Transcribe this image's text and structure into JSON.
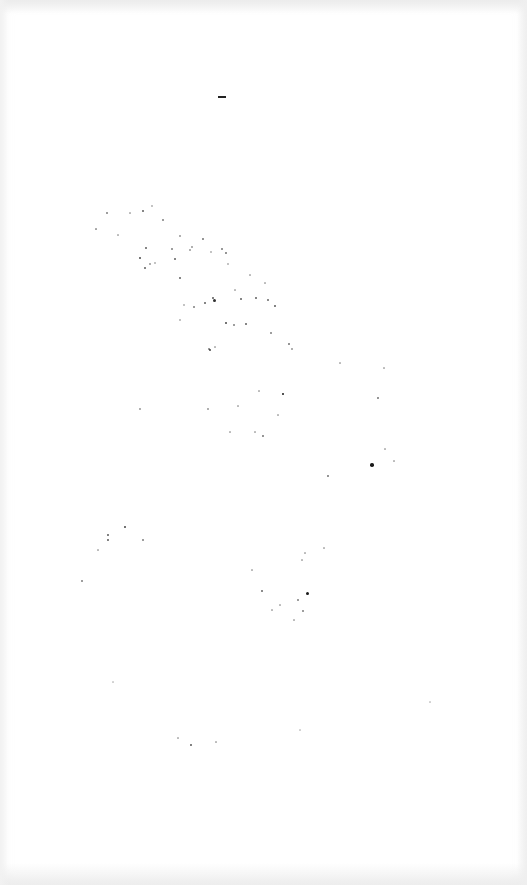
{
  "image": {
    "description": "Near-blank white sheet with scattered dust/speckle noise",
    "background_color": "#ffffff",
    "edge_tint": "#ececec",
    "speckle_color": "#1a1a1a",
    "marks": [
      {
        "type": "dash",
        "x": 218,
        "y": 96,
        "w": 8,
        "h": 2
      }
    ],
    "speckles": [
      [
        107,
        213,
        1.5,
        0.5
      ],
      [
        130,
        213,
        1.2,
        0.3
      ],
      [
        143,
        211,
        2,
        0.7
      ],
      [
        152,
        206,
        1.3,
        0.3
      ],
      [
        163,
        220,
        1.5,
        0.5
      ],
      [
        96,
        229,
        1.2,
        0.4
      ],
      [
        118,
        235,
        1.2,
        0.3
      ],
      [
        146,
        248,
        2,
        0.7
      ],
      [
        140,
        258,
        2.2,
        0.8
      ],
      [
        145,
        268,
        2,
        0.7
      ],
      [
        150,
        264,
        1.3,
        0.4
      ],
      [
        155,
        263,
        1.3,
        0.3
      ],
      [
        172,
        249,
        1.5,
        0.5
      ],
      [
        175,
        259,
        2,
        0.7
      ],
      [
        180,
        236,
        1.3,
        0.4
      ],
      [
        190,
        250,
        1.5,
        0.4
      ],
      [
        192,
        247,
        1.3,
        0.4
      ],
      [
        203,
        239,
        1.8,
        0.6
      ],
      [
        211,
        252,
        1.3,
        0.3
      ],
      [
        222,
        249,
        2,
        0.6
      ],
      [
        226,
        253,
        1.8,
        0.6
      ],
      [
        228,
        264,
        1.3,
        0.3
      ],
      [
        180,
        278,
        2,
        0.7
      ],
      [
        213,
        298,
        1.8,
        0.7
      ],
      [
        214,
        300,
        3,
        0.9
      ],
      [
        205,
        303,
        2,
        0.7
      ],
      [
        194,
        307,
        1.5,
        0.5
      ],
      [
        241,
        299,
        2,
        0.7
      ],
      [
        256,
        298,
        2,
        0.7
      ],
      [
        268,
        300,
        1.6,
        0.6
      ],
      [
        275,
        306,
        1.8,
        0.7
      ],
      [
        226,
        323,
        2.2,
        0.8
      ],
      [
        234,
        325,
        1.5,
        0.5
      ],
      [
        246,
        324,
        2,
        0.7
      ],
      [
        271,
        333,
        1.5,
        0.5
      ],
      [
        209,
        349,
        1.5,
        0.5
      ],
      [
        215,
        347,
        1.2,
        0.3
      ],
      [
        289,
        344,
        1.8,
        0.6
      ],
      [
        292,
        349,
        1.3,
        0.4
      ],
      [
        210,
        350,
        2.4,
        0.8
      ],
      [
        180,
        320,
        1.3,
        0.3
      ],
      [
        184,
        305,
        1.3,
        0.3
      ],
      [
        250,
        275,
        1.2,
        0.3
      ],
      [
        265,
        283,
        1.2,
        0.3
      ],
      [
        235,
        290,
        1.2,
        0.3
      ],
      [
        259,
        391,
        1.2,
        0.3
      ],
      [
        283,
        394,
        2.6,
        1
      ],
      [
        238,
        406,
        1.2,
        0.3
      ],
      [
        263,
        436,
        1.8,
        0.6
      ],
      [
        278,
        415,
        1.2,
        0.3
      ],
      [
        340,
        363,
        1.2,
        0.3
      ],
      [
        378,
        398,
        1.8,
        0.6
      ],
      [
        384,
        368,
        1.2,
        0.3
      ],
      [
        372,
        465,
        3.5,
        1
      ],
      [
        328,
        476,
        1.8,
        0.6
      ],
      [
        385,
        449,
        1.2,
        0.3
      ],
      [
        394,
        461,
        1.2,
        0.3
      ],
      [
        140,
        409,
        1.3,
        0.4
      ],
      [
        208,
        409,
        1.3,
        0.4
      ],
      [
        230,
        432,
        1.2,
        0.3
      ],
      [
        255,
        432,
        1.2,
        0.3
      ],
      [
        125,
        527,
        1.8,
        0.8
      ],
      [
        108,
        535,
        1.8,
        0.7
      ],
      [
        108,
        540,
        1.8,
        0.7
      ],
      [
        143,
        540,
        1.5,
        0.5
      ],
      [
        82,
        581,
        1.5,
        0.5
      ],
      [
        98,
        550,
        1.2,
        0.3
      ],
      [
        262,
        591,
        1.5,
        0.6
      ],
      [
        298,
        600,
        1.5,
        0.5
      ],
      [
        303,
        611,
        1.5,
        0.5
      ],
      [
        307,
        593,
        3,
        1
      ],
      [
        305,
        553,
        1.2,
        0.3
      ],
      [
        302,
        560,
        1.2,
        0.3
      ],
      [
        324,
        548,
        1.2,
        0.3
      ],
      [
        252,
        570,
        1.2,
        0.3
      ],
      [
        280,
        605,
        1.2,
        0.3
      ],
      [
        294,
        620,
        1.2,
        0.3
      ],
      [
        272,
        610,
        1.2,
        0.3
      ],
      [
        191,
        745,
        1.8,
        0.7
      ],
      [
        178,
        738,
        1.2,
        0.3
      ],
      [
        216,
        742,
        1.2,
        0.3
      ],
      [
        113,
        682,
        1.2,
        0.2
      ],
      [
        430,
        702,
        1.2,
        0.2
      ],
      [
        300,
        730,
        1.2,
        0.2
      ]
    ]
  }
}
